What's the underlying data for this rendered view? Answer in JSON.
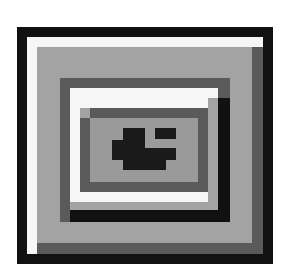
{
  "icon": {
    "name": "window-with-face-icon",
    "colors": {
      "background": "#ffffff",
      "black": "#111111",
      "white": "#f6f6f6",
      "light_gray": "#a3a3a3",
      "mid_gray": "#8c8c8c",
      "dark_gray": "#5a5a5a"
    }
  }
}
